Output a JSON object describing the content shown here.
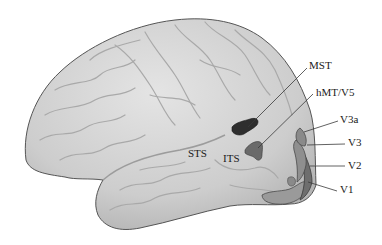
{
  "figure": {
    "colors": {
      "brain_fill": "#cfcfcf",
      "brain_highlight": "#e2e2e2",
      "brain_outline": "#555555",
      "sulcus_line": "#a8a8a8",
      "mst": "#2e2e2e",
      "hmt_v5": "#6a6a6a",
      "v3a": "#8a8a8a",
      "v3": "#8f8f8f",
      "v2": "#6e6e6e",
      "v1": "#9a9a9a",
      "leader_line": "#3a3a3a",
      "label_text": "#1a1a1a"
    }
  },
  "labels": {
    "mst": "MST",
    "hmt_v5": "hMT/V5",
    "v3a": "V3a",
    "v3": "V3",
    "v2": "V2",
    "v1": "V1",
    "sts": "STS",
    "its": "ITS"
  }
}
